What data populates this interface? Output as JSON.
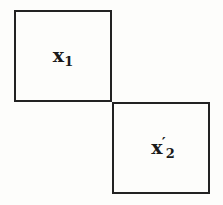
{
  "diagram": {
    "boxes": [
      {
        "id": "box-1",
        "label_base": "x",
        "label_prime": "",
        "label_sub": "1"
      },
      {
        "id": "box-2",
        "label_base": "x",
        "label_prime": "′",
        "label_sub": "2"
      }
    ]
  }
}
